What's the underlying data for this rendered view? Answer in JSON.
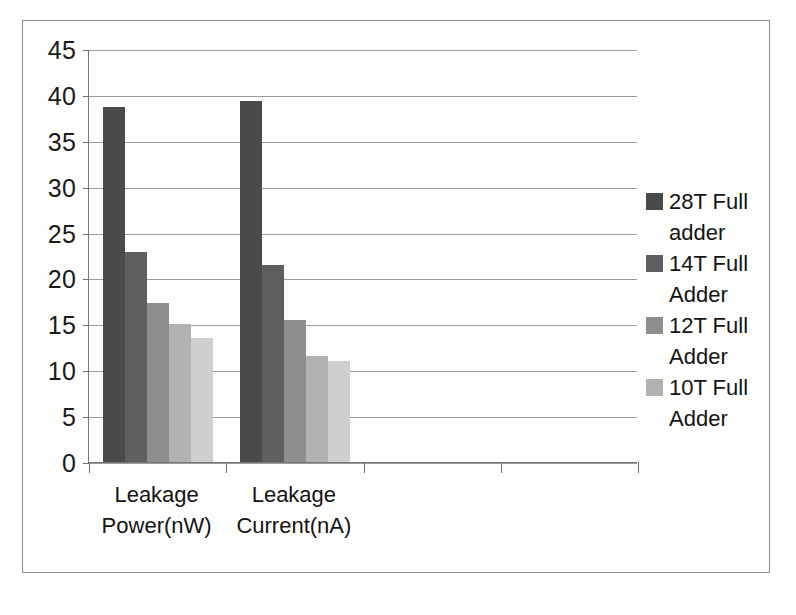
{
  "figure": {
    "caption": ""
  },
  "chart_data": {
    "type": "bar",
    "title": "",
    "xlabel": "",
    "ylabel": "",
    "ylim": [
      0,
      45
    ],
    "ytick_step": 5,
    "yticks": [
      45,
      40,
      35,
      30,
      25,
      20,
      15,
      10,
      5,
      0
    ],
    "grid": true,
    "legend_position": "right",
    "categories": [
      "Leakage Power(nW)",
      "Leakage Current(nA)"
    ],
    "category_lines": [
      [
        "Leakage",
        "Power(nW)"
      ],
      [
        "Leakage",
        "Current(nA)"
      ]
    ],
    "series": [
      {
        "name": "28T Full adder",
        "legend_lines": [
          "28T Full",
          "adder"
        ],
        "color": "#4a4a4a",
        "values": [
          38.7,
          39.3
        ]
      },
      {
        "name": "14T Full Adder",
        "legend_lines": [
          "14T Full",
          "Adder"
        ],
        "color": "#5f5f5f",
        "values": [
          22.9,
          21.5
        ]
      },
      {
        "name": "12T Full Adder",
        "legend_lines": [
          "12T Full",
          "Adder"
        ],
        "color": "#8e8e8e",
        "values": [
          17.3,
          15.5
        ]
      },
      {
        "name": "10T Full Adder",
        "legend_lines": [
          "10T Full",
          "Adder"
        ],
        "color": "#b2b2b2",
        "values": [
          15.0,
          11.5
        ]
      },
      {
        "name": "",
        "legend_lines": [],
        "color": "#cfcfcf",
        "values": [
          13.5,
          11.0
        ]
      }
    ]
  }
}
